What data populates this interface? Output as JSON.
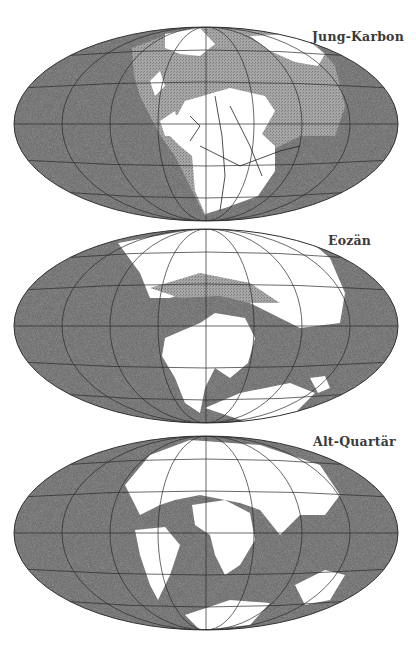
{
  "colors": {
    "ocean": "#6d6d6d",
    "shelf_sea": "#9a9a9a",
    "land": "#ffffff",
    "grid": "#2a2a2a",
    "label": "#3a3a3a"
  },
  "maps": [
    {
      "id": "map-1",
      "label": "Jung-Karbon",
      "top": 26,
      "height": 196,
      "label_x": 312,
      "label_y": 3
    },
    {
      "id": "map-2",
      "label": "Eozän",
      "top": 228,
      "height": 198,
      "label_x": 328,
      "label_y": 5
    },
    {
      "id": "map-3",
      "label": "Alt-Quartär",
      "top": 435,
      "height": 198,
      "label_x": 313,
      "label_y": -1
    }
  ],
  "projection": {
    "type": "Mollweide-like ellipse",
    "cx": 206,
    "rx": 192,
    "ry": 97
  }
}
